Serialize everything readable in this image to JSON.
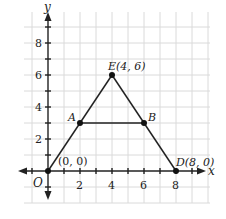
{
  "diagram": {
    "type": "coordinate-plane",
    "axes": {
      "x_label": "x",
      "y_label": "y",
      "origin_label": "O",
      "x_ticks": [
        "2",
        "4",
        "6",
        "8"
      ],
      "y_ticks": [
        "2",
        "4",
        "6",
        "8"
      ]
    },
    "points": [
      {
        "name": "O",
        "label": "(0, 0)",
        "x": 0,
        "y": 0
      },
      {
        "name": "A",
        "label": "A",
        "x": 2,
        "y": 3
      },
      {
        "name": "E",
        "label": "E(4, 6)",
        "x": 4,
        "y": 6
      },
      {
        "name": "B",
        "label": "B",
        "x": 6,
        "y": 3
      },
      {
        "name": "D",
        "label": "D(8, 0)",
        "x": 8,
        "y": 0
      }
    ],
    "segments": [
      [
        "O",
        "E"
      ],
      [
        "E",
        "D"
      ],
      [
        "A",
        "B"
      ],
      [
        "O",
        "D"
      ]
    ],
    "colors": {
      "grid": "#d9d9d9",
      "axis": "#222222",
      "line": "#222222",
      "point": "#111111"
    }
  }
}
